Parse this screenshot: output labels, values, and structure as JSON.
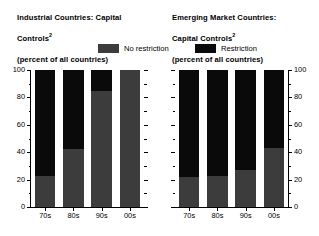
{
  "chart_data": [
    {
      "type": "bar",
      "stacked": true,
      "panel": "left",
      "title": "Industrial Countries: Capital\nControls",
      "title_superscript": "2",
      "subtitle": "(percent of all countries)",
      "xlabel": "",
      "ylabel": "",
      "ylim": [
        0,
        100
      ],
      "yticks": [
        0,
        20,
        40,
        60,
        80,
        100
      ],
      "ytick_labels": [
        "0",
        "20",
        "40",
        "60",
        "80",
        "100"
      ],
      "y_minor_ticks": [
        10,
        30,
        50,
        70,
        90
      ],
      "yaxis_position": "left",
      "grid": false,
      "categories": [
        "70s",
        "80s",
        "90s",
        "00s"
      ],
      "series": [
        {
          "name": "No restriction",
          "color": "#3c3c3c",
          "values": [
            23,
            42,
            85,
            100
          ]
        },
        {
          "name": "Restriction",
          "color": "#0a0a0a",
          "values": [
            77,
            58,
            15,
            0
          ]
        }
      ]
    },
    {
      "type": "bar",
      "stacked": true,
      "panel": "right",
      "title": "Emerging Market Countries:\nCapital Controls",
      "title_superscript": "2",
      "subtitle": "(percent of all countries)",
      "xlabel": "",
      "ylabel": "",
      "ylim": [
        0,
        100
      ],
      "yticks": [
        0,
        20,
        40,
        60,
        80,
        100
      ],
      "ytick_labels": [
        "0",
        "20",
        "40",
        "60",
        "80",
        "100"
      ],
      "y_minor_ticks": [
        10,
        30,
        50,
        70,
        90
      ],
      "yaxis_position": "right",
      "grid": false,
      "categories": [
        "70s",
        "80s",
        "90s",
        "00s"
      ],
      "series": [
        {
          "name": "No restriction",
          "color": "#3c3c3c",
          "values": [
            22,
            23,
            27,
            43
          ]
        },
        {
          "name": "Restriction",
          "color": "#0a0a0a",
          "values": [
            78,
            77,
            73,
            57
          ]
        }
      ]
    }
  ],
  "titles": {
    "left_line1": "Industrial Countries: Capital",
    "left_line2": "Controls",
    "left_sup": "2",
    "left_line3": "(percent of all countries)",
    "right_line1": "Emerging Market Countries:",
    "right_line2": "Capital Controls",
    "right_sup": "2",
    "right_line3": "(percent of all countries)"
  },
  "legend": {
    "no_restriction": {
      "label": "No restriction",
      "color": "#3c3c3c"
    },
    "restriction": {
      "label": "Restriction",
      "color": "#0a0a0a"
    }
  },
  "axes": {
    "ytick_labels": [
      "100",
      "80",
      "60",
      "40",
      "20",
      "0"
    ],
    "xtick_labels": [
      "70s",
      "80s",
      "90s",
      "00s"
    ]
  },
  "colors": {
    "background": "#ffffff",
    "ink": "#000000",
    "no_restriction": "#3c3c3c",
    "restriction": "#0a0a0a"
  }
}
